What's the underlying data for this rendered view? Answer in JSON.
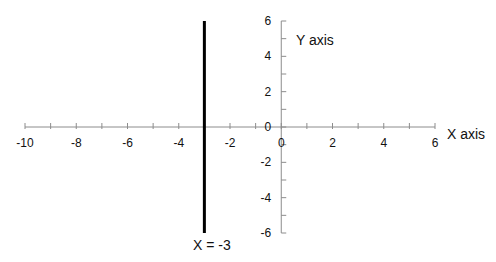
{
  "chart_data": {
    "type": "line",
    "title": "",
    "xlabel": "X axis",
    "ylabel": "Y axis",
    "xlim": [
      -10,
      6
    ],
    "ylim": [
      -6,
      6
    ],
    "grid": false,
    "x_major_ticks": [
      -10,
      -8,
      -6,
      -4,
      -2,
      0,
      2,
      4,
      6
    ],
    "x_minor_ticks": [
      -9,
      -7,
      -5,
      -3,
      -1,
      1,
      3,
      5
    ],
    "y_major_ticks": [
      -6,
      -4,
      -2,
      0,
      2,
      4,
      6
    ],
    "y_minor_ticks": [
      -5,
      -3,
      -1,
      1,
      3,
      5
    ],
    "x_tick_labels": [
      "-10",
      "-8",
      "-6",
      "-4",
      "-2",
      "0",
      "2",
      "4",
      "6"
    ],
    "y_tick_labels": [
      "-6",
      "-4",
      "-2",
      "0",
      "2",
      "4",
      "6"
    ],
    "series": [
      {
        "name": "X = -3",
        "x": [
          -3,
          -3
        ],
        "y": [
          6,
          -6
        ],
        "color": "#000000",
        "line_width": 3
      }
    ],
    "annotations": [
      {
        "text": "X = -3",
        "x": -3,
        "y": -6.7
      },
      {
        "text": "Y axis",
        "x": 1,
        "y": 5
      },
      {
        "text": "X axis",
        "x": 7.2,
        "y": -0.4
      }
    ],
    "axis_color": "#8c8c8c",
    "legend": "none"
  }
}
